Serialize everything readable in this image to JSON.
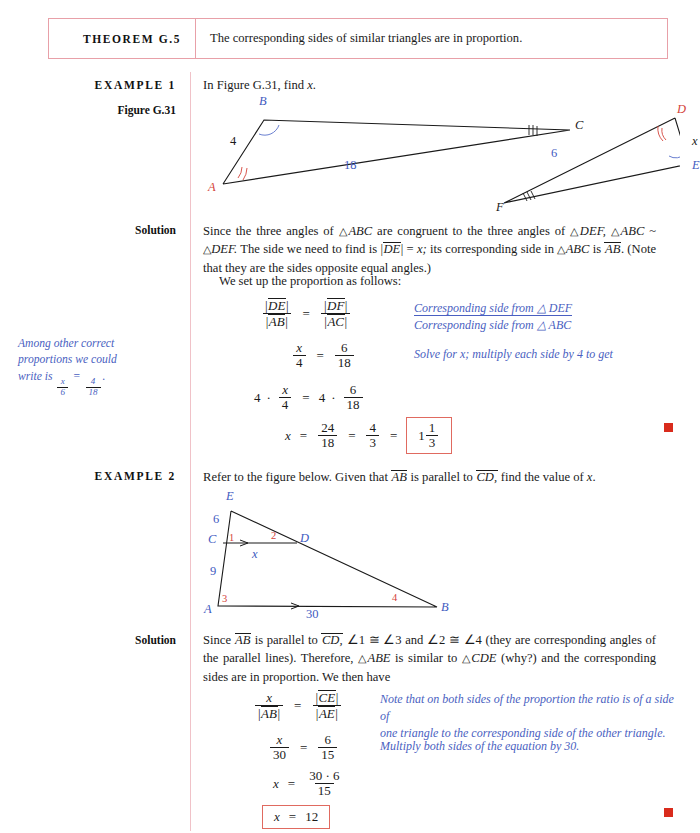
{
  "theorem": {
    "label": "THEOREM G.5",
    "text": "The corresponding sides of similar triangles are in proportion."
  },
  "example1": {
    "label": "EXAMPLE 1",
    "prompt_pre": "In Figure G.31, find ",
    "prompt_var": "x",
    "prompt_post": ".",
    "figure_label": "Figure G.31",
    "solution_label": "Solution",
    "figure": {
      "name": "figure-g31",
      "vertices": [
        "A",
        "B",
        "C",
        "D",
        "E",
        "F"
      ],
      "side_labels": [
        "4",
        "18",
        "6",
        "x"
      ],
      "angle_marks": {
        "A": "double-tick",
        "B": "single-arc",
        "C": "triple-tick",
        "D": "double-tick",
        "E": "single-arc",
        "F": "triple-tick"
      }
    },
    "solution_p1_parts": {
      "s1": "Since the three angles of ",
      "t1": "ABC",
      "s2": " are congruent to the three angles of ",
      "t2": "DEF,",
      "s3": "",
      "t3": "ABC",
      "s4": " ~ ",
      "t4": "DEF.",
      "s5": " The side we need to find is |",
      "dv1": "DE",
      "s6": "| = ",
      "xv": "x;",
      "s7": " its corresponding side in ",
      "t5": "ABC",
      "s8": " is ",
      "dv2": "AB",
      "s9": ". (Note that they are the sides opposite equal angles.)"
    },
    "solution_p2": "We set up the proportion as follows:",
    "annotations": [
      "Corresponding side from △ DEF",
      "Corresponding side from △ ABC",
      "Solve for x; multiply each side by 4 to get"
    ],
    "equations": {
      "e1_lhs_num": "DE",
      "e1_lhs_den": "AB",
      "e1_rhs_num": "DF",
      "e1_rhs_den": "AC",
      "e2_lhs_num": "x",
      "e2_lhs_den": "4",
      "e2_rhs_num": "6",
      "e2_rhs_den": "18",
      "e3_coef": "4",
      "e3_dot": "·",
      "e3_lhs_num": "x",
      "e3_lhs_den": "4",
      "e3_rcoef": "4",
      "e3_rhs_num": "6",
      "e3_rhs_den": "18",
      "e4_var": "x",
      "e4_f1_num": "24",
      "e4_f1_den": "18",
      "e4_f2_num": "4",
      "e4_f2_den": "3",
      "e4_ans_whole": "1",
      "e4_ans_num": "1",
      "e4_ans_den": "3"
    },
    "margin_note": {
      "line1": "Among other correct",
      "line2": "proportions we could",
      "line3_pre": "write is ",
      "f1_num": "x",
      "f1_den": "6",
      "eq": " = ",
      "f2_num": "4",
      "f2_den": "18",
      "line3_post": "."
    }
  },
  "example2": {
    "label": "EXAMPLE 2",
    "solution_label": "Solution",
    "prompt_parts": {
      "p1": "Refer to the figure below. Given that ",
      "ab": "AB",
      "p2": " is parallel to ",
      "cd": "CD,",
      "p3": " find the value of ",
      "xv": "x",
      "p4": "."
    },
    "figure": {
      "name": "figure-example2",
      "vertices": [
        "A",
        "B",
        "C",
        "D",
        "E"
      ],
      "side_labels": [
        "6",
        "9",
        "x",
        "30"
      ],
      "angle_numbers": [
        "1",
        "2",
        "3",
        "4"
      ],
      "parallel_marks": 2
    },
    "solution_parts": {
      "s1": "Since ",
      "ab": "AB",
      "s2": " is parallel to ",
      "cd": "CD,",
      "s3": " ∠1 ≅ ∠3 and ∠2 ≅ ∠4 (they are corresponding angles of the parallel lines). Therefore, ",
      "t1": "ABE",
      "s4": " is similar to ",
      "t2": "CDE",
      "s5": " (why?) and the corresponding sides are in proportion. We then have"
    },
    "annotations": [
      "Note that on both sides of the proportion the ratio is of a side of",
      "one triangle to the corresponding side of the other triangle.",
      "Multiply both sides of the equation by 30."
    ],
    "equations": {
      "e1_lhs_num": "x",
      "e1_lhs_den": "AB",
      "e1_rhs_num": "CE",
      "e1_rhs_den": "AE",
      "e2_lhs_num": "x",
      "e2_lhs_den": "30",
      "e2_rhs_num": "6",
      "e2_rhs_den": "15",
      "e3_var": "x",
      "e3_num": "30 · 6",
      "e3_den": "15",
      "e4_var": "x",
      "e4_val": "12"
    }
  },
  "colors": {
    "theorem_border": "#e8a0a8",
    "rule": "#f0c2c8",
    "annotation": "#4a5fc1",
    "label_blue": "#3f5bbf",
    "label_red": "#d4433a",
    "answer_box": "#e06a60",
    "endmark": "#d92b1c"
  }
}
